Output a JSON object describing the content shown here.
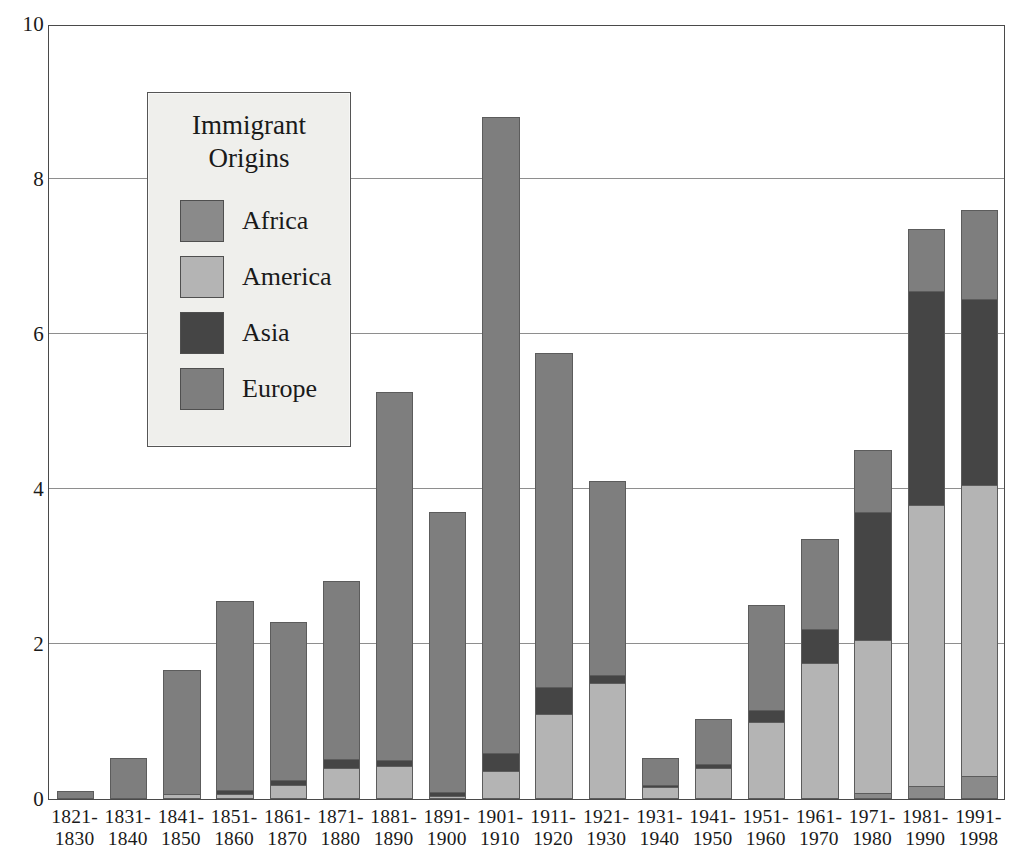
{
  "chart_data": {
    "type": "bar",
    "subtype": "stacked-vertical",
    "title": "",
    "xlabel": "",
    "ylabel": "",
    "ylim": [
      0,
      10
    ],
    "y_ticks": [
      0,
      2,
      4,
      6,
      8,
      10
    ],
    "y_tick_labels": [
      "0",
      "2",
      "4",
      "6",
      "8",
      "10"
    ],
    "grid": true,
    "grid_axis": "y",
    "legend": {
      "title_lines": [
        "Immigrant",
        "Origins"
      ],
      "position": "inside-upper-left",
      "entries": [
        {
          "name": "Africa",
          "color": "#8a8a8a"
        },
        {
          "name": "America",
          "color": "#b4b4b4"
        },
        {
          "name": "Asia",
          "color": "#454545"
        },
        {
          "name": "Europe",
          "color": "#7e7e7e"
        }
      ]
    },
    "categories": [
      "1821-1830",
      "1831-1840",
      "1841-1850",
      "1851-1860",
      "1861-1870",
      "1871-1880",
      "1881-1890",
      "1891-1900",
      "1901-1910",
      "1911-1920",
      "1921-1930",
      "1931-1940",
      "1941-1950",
      "1951-1960",
      "1961-1970",
      "1971-1980",
      "1981-1990",
      "1991-1998"
    ],
    "category_label_lines": [
      [
        "1821-",
        "1830"
      ],
      [
        "1831-",
        "1840"
      ],
      [
        "1841-",
        "1850"
      ],
      [
        "1851-",
        "1860"
      ],
      [
        "1861-",
        "1870"
      ],
      [
        "1871-",
        "1880"
      ],
      [
        "1881-",
        "1890"
      ],
      [
        "1891-",
        "1900"
      ],
      [
        "1901-",
        "1910"
      ],
      [
        "1911-",
        "1920"
      ],
      [
        "1921-",
        "1930"
      ],
      [
        "1931-",
        "1940"
      ],
      [
        "1941-",
        "1950"
      ],
      [
        "1951-",
        "1960"
      ],
      [
        "1961-",
        "1970"
      ],
      [
        "1971-",
        "1980"
      ],
      [
        "1981-",
        "1990"
      ],
      [
        "1991-",
        "1998"
      ]
    ],
    "stack_order_bottom_to_top": [
      "Africa",
      "America",
      "Asia",
      "Europe"
    ],
    "series": [
      {
        "name": "Africa",
        "color": "#8a8a8a",
        "values": [
          0,
          0,
          0,
          0,
          0,
          0,
          0,
          0,
          0,
          0,
          0,
          0,
          0,
          0,
          0,
          0.08,
          0.17,
          0.3
        ]
      },
      {
        "name": "America",
        "color": "#b4b4b4",
        "values": [
          0.01,
          0.01,
          0.06,
          0.07,
          0.18,
          0.4,
          0.43,
          0.04,
          0.36,
          1.1,
          1.5,
          0.16,
          0.4,
          1.0,
          1.75,
          1.97,
          3.63,
          3.75
        ]
      },
      {
        "name": "Asia",
        "color": "#454545",
        "values": [
          0,
          0,
          0,
          0.04,
          0.06,
          0.12,
          0.07,
          0.05,
          0.24,
          0.35,
          0.1,
          0.02,
          0.05,
          0.15,
          0.45,
          1.65,
          2.75,
          2.4
        ]
      },
      {
        "name": "Europe",
        "color": "#7e7e7e",
        "values": [
          0.09,
          0.52,
          1.61,
          2.45,
          2.05,
          2.29,
          4.75,
          3.61,
          8.2,
          4.3,
          2.5,
          0.35,
          0.58,
          1.35,
          1.15,
          0.8,
          0.8,
          1.15
        ]
      }
    ],
    "totals": [
      0.1,
      0.53,
      1.67,
      2.56,
      2.29,
      2.81,
      5.25,
      3.7,
      8.8,
      5.75,
      4.1,
      0.53,
      1.03,
      2.5,
      3.35,
      4.5,
      7.35,
      7.6
    ]
  }
}
